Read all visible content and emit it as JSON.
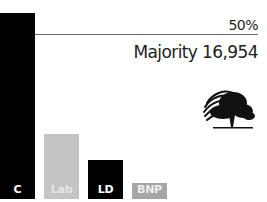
{
  "chart_data": {
    "type": "bar",
    "title": "",
    "categories": [
      "C",
      "Lab",
      "LD",
      "BNP"
    ],
    "values": [
      56.4,
      19.7,
      11.8,
      4.8
    ],
    "colors": [
      "#000000",
      "#c4c4c4",
      "#000000",
      "#a6a6a6"
    ],
    "label_colors": [
      "#ffffff",
      "#e6e6e6",
      "#ffffff",
      "#eeeeee"
    ],
    "xlabel": "",
    "ylabel": "",
    "ylim": [
      0,
      60
    ],
    "grid": false,
    "legend": "none",
    "reference_line": {
      "value": 50,
      "label": "50%"
    },
    "annotations": [
      "Majority 16,954"
    ]
  },
  "threshold": {
    "label": "50%"
  },
  "majority": {
    "label": "Majority 16,954"
  },
  "logo": {
    "icon": "conservative-tree-logo",
    "color": "#111111"
  }
}
